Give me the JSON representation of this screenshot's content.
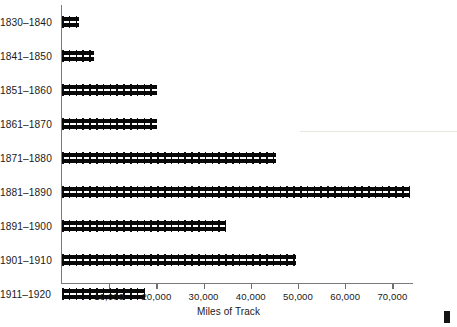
{
  "chart_data": {
    "type": "bar",
    "orientation": "horizontal",
    "title": "",
    "xlabel": "Miles of Track",
    "ylabel": "",
    "xlim": [
      0,
      75000
    ],
    "grid": false,
    "legend": null,
    "bar_style": "railroad-track",
    "categories": [
      "1830–1840",
      "1841–1850",
      "1851–1860",
      "1861–1870",
      "1871–1880",
      "1881–1890",
      "1891–1900",
      "1901–1910",
      "1911–1920"
    ],
    "values": [
      3600,
      6800,
      20100,
      20100,
      45300,
      73700,
      34700,
      49600,
      17600
    ],
    "xticks": [
      10000,
      20000,
      30000,
      40000,
      50000,
      60000,
      70000
    ],
    "xticklabels": [
      "10,000",
      "20,000",
      "30,000",
      "40,000",
      "50,000",
      "60,000",
      "70,000"
    ],
    "axis_color": "#7b7b7b",
    "bar_color": "#0d0d0d",
    "background_color": "#ffffff"
  },
  "axis": {
    "x_title": "Miles of Track"
  },
  "rows": [
    {
      "label": "1830–1840",
      "value": 3600
    },
    {
      "label": "1841–1850",
      "value": 6800
    },
    {
      "label": "1851–1860",
      "value": 20100
    },
    {
      "label": "1861–1870",
      "value": 20100
    },
    {
      "label": "1871–1880",
      "value": 45300
    },
    {
      "label": "1881–1890",
      "value": 73700
    },
    {
      "label": "1891–1900",
      "value": 34700
    },
    {
      "label": "1901–1910",
      "value": 49600
    },
    {
      "label": "1911–1920",
      "value": 17600
    }
  ],
  "ticks": [
    {
      "value": 10000,
      "label": "10,000"
    },
    {
      "value": 20000,
      "label": "20,000"
    },
    {
      "value": 30000,
      "label": "30,000"
    },
    {
      "value": 40000,
      "label": "40,000"
    },
    {
      "value": 50000,
      "label": "50,000"
    },
    {
      "value": 60000,
      "label": "60,000"
    },
    {
      "value": 70000,
      "label": "70,000"
    }
  ]
}
